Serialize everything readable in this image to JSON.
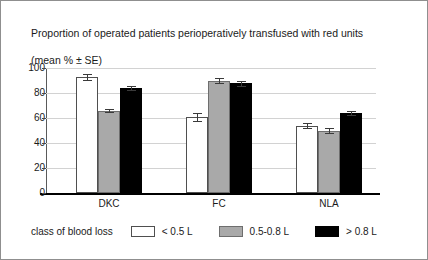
{
  "chart_data": {
    "type": "bar",
    "title": "Proportion of operated patients perioperatively transfused with red units\n(mean % ± SE)",
    "title_line1": "Proportion of operated patients perioperatively transfused with red units",
    "title_line2": "(mean % ± SE)",
    "xlabel": "",
    "ylabel": "",
    "ylim": [
      0,
      100
    ],
    "yticks": [
      0,
      20,
      40,
      60,
      80,
      100
    ],
    "ytick_labels": [
      "0",
      "20",
      "40",
      "60",
      "80",
      "100"
    ],
    "grid": true,
    "legend_position": "bottom",
    "legend_title": "class of blood loss",
    "categories": [
      "DKC",
      "FC",
      "NLA"
    ],
    "series": [
      {
        "name": "< 0.5 L",
        "color": "#ffffff",
        "values": [
          93,
          61,
          54
        ],
        "errors": [
          2.5,
          3.0,
          2.0
        ]
      },
      {
        "name": "0.5-0.8 L",
        "color": "#a9a9a9",
        "values": [
          66,
          90,
          50
        ],
        "errors": [
          1.5,
          2.0,
          2.0
        ]
      },
      {
        "name": "> 0.8 L",
        "color": "#000000",
        "values": [
          84,
          88,
          64
        ],
        "errors": [
          1.5,
          2.0,
          1.5
        ]
      }
    ]
  }
}
